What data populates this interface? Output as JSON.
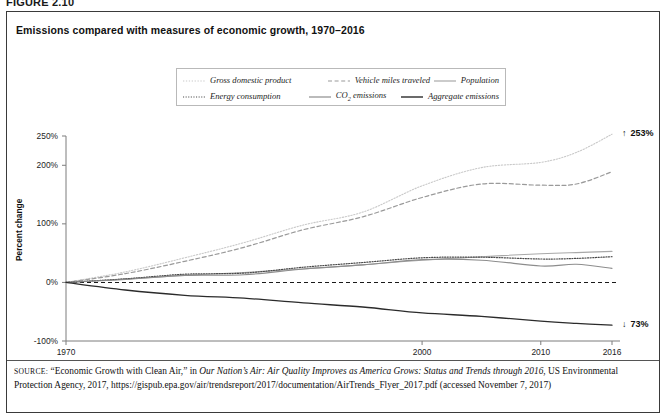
{
  "figure": {
    "label": "FIGURE 2.10",
    "title": "Emissions compared with measures of economic growth, 1970–2016"
  },
  "legend": {
    "rows": [
      [
        {
          "name": "gross-domestic-product",
          "label": "Gross domestic product",
          "style": "dotted-light",
          "color": "#c9c9c9"
        },
        {
          "name": "vehicle-miles-traveled",
          "label": "Vehicle miles traveled",
          "style": "dashed",
          "color": "#9a9a9a"
        },
        {
          "name": "population",
          "label": "Population",
          "style": "solid",
          "color": "#a8a8a8"
        }
      ],
      [
        {
          "name": "energy-consumption",
          "label": "Energy consumption",
          "style": "dotted",
          "color": "#4a4a4a"
        },
        {
          "name": "co2-emissions",
          "label": "CO",
          "label_sub": "2",
          "label_rest": " emissions",
          "style": "solid",
          "color": "#8d8d8d"
        },
        {
          "name": "aggregate-emissions",
          "label": "Aggregate emissions",
          "style": "solid-dark",
          "color": "#2b2b2b"
        }
      ]
    ]
  },
  "annotations": {
    "top": {
      "arrow": "↑",
      "value": "253%"
    },
    "bottom": {
      "arrow": "↓",
      "value": "73%"
    }
  },
  "source": {
    "prefix": "SOURCE:",
    "text_1": "“Economic Growth with Clean Air,” in ",
    "italic_1": "Our Nation’s Air: Air Quality Improves as America Grows: Status and Trends through 2016",
    "text_2": ", US Environmental Protection Agency, 2017, https://gispub.epa.gov/air/trendsreport/2017/documentation/AirTrends_Flyer_2017.pdf (accessed November 7, 2017)"
  },
  "chart_data": {
    "type": "line",
    "title": "Emissions compared with measures of economic growth, 1970–2016",
    "xlabel": "",
    "ylabel": "Percent change",
    "xlim": [
      1970,
      2016
    ],
    "ylim": [
      -100,
      250
    ],
    "yticks": [
      "-100%",
      "0%",
      "100%",
      "200%",
      "250%"
    ],
    "ytick_values": [
      -100,
      0,
      100,
      200,
      250
    ],
    "xticks": [
      "1970",
      "2000",
      "2010",
      "2016"
    ],
    "xtick_values": [
      1970,
      2000,
      2010,
      2016
    ],
    "grid": false,
    "legend_position": "top-center",
    "zero_reference_line": 0,
    "x": [
      1970,
      1975,
      1980,
      1985,
      1990,
      1995,
      2000,
      2005,
      2010,
      2013,
      2016
    ],
    "series": [
      {
        "name": "Gross domestic product",
        "style": "dotted-light",
        "color": "#c9c9c9",
        "values": [
          0,
          18,
          42,
          68,
          98,
          120,
          165,
          196,
          205,
          222,
          253
        ],
        "end_label": "253%"
      },
      {
        "name": "Vehicle miles traveled",
        "style": "dashed",
        "color": "#9a9a9a",
        "values": [
          0,
          15,
          36,
          60,
          90,
          112,
          145,
          168,
          166,
          168,
          189
        ]
      },
      {
        "name": "Population",
        "style": "solid",
        "color": "#a8a8a8",
        "values": [
          0,
          6,
          12,
          17,
          23,
          30,
          38,
          44,
          49,
          51,
          53
        ]
      },
      {
        "name": "Energy consumption",
        "style": "dotted",
        "color": "#4a4a4a",
        "values": [
          0,
          6,
          14,
          16,
          26,
          34,
          42,
          43,
          40,
          41,
          44
        ]
      },
      {
        "name": "CO2 emissions",
        "style": "solid",
        "color": "#8d8d8d",
        "values": [
          0,
          5,
          12,
          13,
          23,
          30,
          39,
          38,
          28,
          31,
          24
        ]
      },
      {
        "name": "Aggregate emissions",
        "style": "solid-dark",
        "color": "#2b2b2b",
        "values": [
          0,
          -13,
          -22,
          -27,
          -35,
          -42,
          -52,
          -58,
          -66,
          -70,
          -73
        ],
        "end_label": "73%"
      }
    ]
  }
}
